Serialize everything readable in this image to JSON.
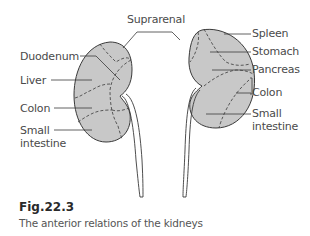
{
  "figure": {
    "number": "Fig.22.3",
    "caption": "The anterior relations of the kidneys"
  },
  "colors": {
    "kidney_fill": "#c8c8c8",
    "outline": "#3a3a3a",
    "text": "#4a4a4a"
  },
  "labels": {
    "top": "Suprarenal",
    "right_kidney": [
      {
        "text": "Duodenum"
      },
      {
        "text": "Liver"
      },
      {
        "text": "Colon"
      },
      {
        "text": "Small"
      },
      {
        "text": "intestine"
      }
    ],
    "left_kidney": [
      {
        "text": "Spleen"
      },
      {
        "text": "Stomach"
      },
      {
        "text": "Pancreas"
      },
      {
        "text": "Colon"
      },
      {
        "text": "Small"
      },
      {
        "text": "intestine"
      }
    ]
  }
}
